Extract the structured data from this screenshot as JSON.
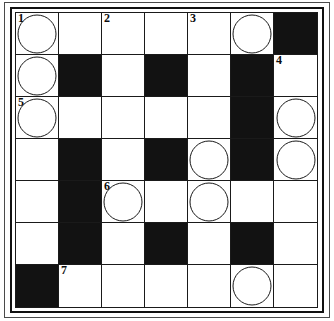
{
  "puzzle": {
    "type": "crossword-grid",
    "rows": 7,
    "columns": 7,
    "colors": {
      "block": "#121212",
      "open": "#ffffff",
      "rule": "#1a1a1a",
      "frame": "#4a4a4a"
    },
    "numbers_visible": [
      "1",
      "2",
      "3",
      "4",
      "5",
      "6",
      "7"
    ],
    "circled_cell_count": 11,
    "black_cell_count": 16,
    "grid": [
      [
        {
          "block": false,
          "number": "1",
          "circle": true,
          "letter": ""
        },
        {
          "block": false,
          "number": "",
          "circle": false,
          "letter": ""
        },
        {
          "block": false,
          "number": "2",
          "circle": false,
          "letter": ""
        },
        {
          "block": false,
          "number": "",
          "circle": false,
          "letter": ""
        },
        {
          "block": false,
          "number": "3",
          "circle": false,
          "letter": ""
        },
        {
          "block": false,
          "number": "",
          "circle": true,
          "letter": ""
        },
        {
          "block": true,
          "number": "",
          "circle": false,
          "letter": ""
        }
      ],
      [
        {
          "block": false,
          "number": "",
          "circle": true,
          "letter": ""
        },
        {
          "block": true,
          "number": "",
          "circle": false,
          "letter": ""
        },
        {
          "block": false,
          "number": "",
          "circle": false,
          "letter": ""
        },
        {
          "block": true,
          "number": "",
          "circle": false,
          "letter": ""
        },
        {
          "block": false,
          "number": "",
          "circle": false,
          "letter": ""
        },
        {
          "block": true,
          "number": "",
          "circle": false,
          "letter": ""
        },
        {
          "block": false,
          "number": "4",
          "circle": false,
          "letter": ""
        }
      ],
      [
        {
          "block": false,
          "number": "5",
          "circle": true,
          "letter": ""
        },
        {
          "block": false,
          "number": "",
          "circle": false,
          "letter": ""
        },
        {
          "block": false,
          "number": "",
          "circle": false,
          "letter": ""
        },
        {
          "block": false,
          "number": "",
          "circle": false,
          "letter": ""
        },
        {
          "block": false,
          "number": "",
          "circle": false,
          "letter": ""
        },
        {
          "block": true,
          "number": "",
          "circle": false,
          "letter": ""
        },
        {
          "block": false,
          "number": "",
          "circle": true,
          "letter": ""
        }
      ],
      [
        {
          "block": false,
          "number": "",
          "circle": false,
          "letter": ""
        },
        {
          "block": true,
          "number": "",
          "circle": false,
          "letter": ""
        },
        {
          "block": false,
          "number": "",
          "circle": false,
          "letter": ""
        },
        {
          "block": true,
          "number": "",
          "circle": false,
          "letter": ""
        },
        {
          "block": false,
          "number": "",
          "circle": true,
          "letter": ""
        },
        {
          "block": true,
          "number": "",
          "circle": false,
          "letter": ""
        },
        {
          "block": false,
          "number": "",
          "circle": true,
          "letter": ""
        }
      ],
      [
        {
          "block": false,
          "number": "",
          "circle": false,
          "letter": ""
        },
        {
          "block": true,
          "number": "",
          "circle": false,
          "letter": ""
        },
        {
          "block": false,
          "number": "6",
          "circle": true,
          "letter": ""
        },
        {
          "block": false,
          "number": "",
          "circle": false,
          "letter": ""
        },
        {
          "block": false,
          "number": "",
          "circle": true,
          "letter": ""
        },
        {
          "block": false,
          "number": "",
          "circle": false,
          "letter": ""
        },
        {
          "block": false,
          "number": "",
          "circle": false,
          "letter": ""
        }
      ],
      [
        {
          "block": false,
          "number": "",
          "circle": false,
          "letter": ""
        },
        {
          "block": true,
          "number": "",
          "circle": false,
          "letter": ""
        },
        {
          "block": false,
          "number": "",
          "circle": false,
          "letter": ""
        },
        {
          "block": true,
          "number": "",
          "circle": false,
          "letter": ""
        },
        {
          "block": false,
          "number": "",
          "circle": false,
          "letter": ""
        },
        {
          "block": true,
          "number": "",
          "circle": false,
          "letter": ""
        },
        {
          "block": false,
          "number": "",
          "circle": false,
          "letter": ""
        }
      ],
      [
        {
          "block": true,
          "number": "",
          "circle": false,
          "letter": ""
        },
        {
          "block": false,
          "number": "7",
          "circle": false,
          "letter": ""
        },
        {
          "block": false,
          "number": "",
          "circle": false,
          "letter": ""
        },
        {
          "block": false,
          "number": "",
          "circle": false,
          "letter": ""
        },
        {
          "block": false,
          "number": "",
          "circle": false,
          "letter": ""
        },
        {
          "block": false,
          "number": "",
          "circle": true,
          "letter": ""
        },
        {
          "block": false,
          "number": "",
          "circle": false,
          "letter": ""
        }
      ]
    ]
  }
}
